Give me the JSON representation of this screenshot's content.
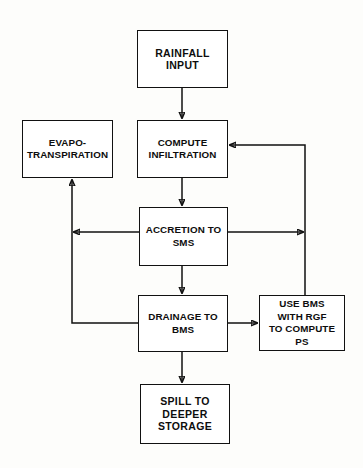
{
  "diagram": {
    "background_color": "#fdfdfb",
    "line_color": "#111111",
    "box_fill": "#ffffff",
    "nodes": [
      {
        "id": "rainfall-input",
        "label": "RAINFALL\nINPUT",
        "x": 137,
        "y": 30,
        "w": 91,
        "h": 58
      },
      {
        "id": "evapotranspiration",
        "label": "EVAPO-\nTRANSPIRATION",
        "x": 22,
        "y": 120,
        "w": 91,
        "h": 58
      },
      {
        "id": "compute-infiltration",
        "label": "COMPUTE\nINFILTRATION",
        "x": 137,
        "y": 120,
        "w": 91,
        "h": 58
      },
      {
        "id": "accretion-to-sms",
        "label": "ACCRETION TO\nSMS",
        "x": 139,
        "y": 207,
        "w": 89,
        "h": 59
      },
      {
        "id": "drainage-to-bms",
        "label": "DRAINAGE TO\nBMS",
        "x": 138,
        "y": 295,
        "w": 90,
        "h": 57
      },
      {
        "id": "use-bms-with-rgf",
        "label": "USE BMS\nWITH RGF\nTO COMPUTE\nPS",
        "x": 259,
        "y": 295,
        "w": 86,
        "h": 56
      },
      {
        "id": "spill-to-deeper-storage",
        "label": "SPILL TO\nDEEPER\nSTORAGE",
        "x": 140,
        "y": 384,
        "w": 90,
        "h": 60
      }
    ],
    "edges": [
      {
        "id": "rainfall-to-compute",
        "from": "rainfall-input",
        "to": "compute-infiltration",
        "kind": "vertical-arrow"
      },
      {
        "id": "compute-to-accretion",
        "from": "compute-infiltration",
        "to": "accretion-to-sms",
        "kind": "vertical-arrow"
      },
      {
        "id": "accretion-to-drainage",
        "from": "accretion-to-sms",
        "to": "drainage-to-bms",
        "kind": "vertical-arrow"
      },
      {
        "id": "drainage-to-spill",
        "from": "drainage-to-bms",
        "to": "spill-to-deeper-storage",
        "kind": "vertical-arrow"
      },
      {
        "id": "drainage-to-use-bms",
        "from": "drainage-to-bms",
        "to": "use-bms-with-rgf",
        "kind": "horizontal-arrow"
      },
      {
        "id": "accretion-to-evapo-return",
        "from": "accretion-to-sms",
        "to": "evapotranspiration",
        "kind": "left-feedback"
      },
      {
        "id": "drainage-to-evapo-return",
        "from": "drainage-to-bms",
        "to": "evapotranspiration",
        "kind": "left-feedback"
      },
      {
        "id": "accretion-to-usebms-riser",
        "from": "accretion-to-sms",
        "to": "use-bms-with-rgf",
        "kind": "right-riser"
      },
      {
        "id": "usebms-to-compute-return",
        "from": "use-bms-with-rgf",
        "to": "compute-infiltration",
        "kind": "right-feedback"
      }
    ]
  }
}
